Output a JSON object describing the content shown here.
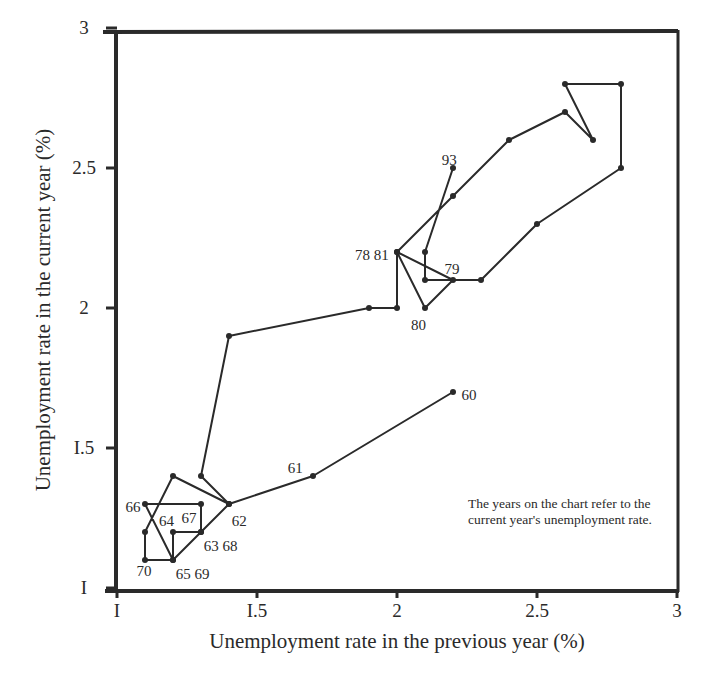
{
  "chart_data": {
    "type": "line",
    "subtype": "connected-scatter",
    "title": "",
    "xlabel": "Unemployment rate in the previous year (%)",
    "ylabel": "Unemployment rate in the current year (%)",
    "xlim": [
      1,
      3
    ],
    "ylim": [
      1,
      3
    ],
    "x_ticks": [
      "I",
      "I.5",
      "2",
      "2.5",
      "3"
    ],
    "x_tick_values": [
      1,
      1.5,
      2,
      2.5,
      3
    ],
    "y_ticks": [
      "I",
      "I.5",
      "2",
      "2.5",
      "3"
    ],
    "y_tick_values": [
      1,
      1.5,
      2,
      2.5,
      3
    ],
    "grid": false,
    "legend": null,
    "annotation": "The years on the chart refer to the current year's unemployment rate.",
    "series": [
      {
        "name": "Unemployment rate path 1960-1993",
        "points": [
          {
            "year": "60",
            "x": 2.2,
            "y": 1.7,
            "label": "60"
          },
          {
            "year": "61",
            "x": 1.7,
            "y": 1.4,
            "label": "61"
          },
          {
            "year": "62",
            "x": 1.4,
            "y": 1.3,
            "label": "62"
          },
          {
            "year": "63",
            "x": 1.3,
            "y": 1.2,
            "label": "63 68"
          },
          {
            "year": "64",
            "x": 1.2,
            "y": 1.1,
            "label": "65 69"
          },
          {
            "year": "65",
            "x": 1.1,
            "y": 1.3,
            "label": "66"
          },
          {
            "year": "66",
            "x": 1.3,
            "y": 1.3,
            "label": "67"
          },
          {
            "year": "67",
            "x": 1.3,
            "y": 1.2,
            "label": ""
          },
          {
            "year": "68",
            "x": 1.2,
            "y": 1.2,
            "label": "64"
          },
          {
            "year": "69",
            "x": 1.2,
            "y": 1.1,
            "label": ""
          },
          {
            "year": "70",
            "x": 1.1,
            "y": 1.1,
            "label": "70"
          },
          {
            "year": "71",
            "x": 1.1,
            "y": 1.2,
            "label": ""
          },
          {
            "year": "72",
            "x": 1.2,
            "y": 1.4,
            "label": ""
          },
          {
            "year": "73",
            "x": 1.4,
            "y": 1.3,
            "label": ""
          },
          {
            "year": "74",
            "x": 1.3,
            "y": 1.4,
            "label": ""
          },
          {
            "year": "75",
            "x": 1.4,
            "y": 1.9,
            "label": ""
          },
          {
            "year": "76",
            "x": 1.9,
            "y": 2.0,
            "label": ""
          },
          {
            "year": "77",
            "x": 2.0,
            "y": 2.0,
            "label": ""
          },
          {
            "year": "78",
            "x": 2.0,
            "y": 2.2,
            "label": "78 81"
          },
          {
            "year": "79",
            "x": 2.2,
            "y": 2.1,
            "label": "79"
          },
          {
            "year": "80",
            "x": 2.1,
            "y": 2.0,
            "label": "80"
          },
          {
            "year": "81",
            "x": 2.0,
            "y": 2.2,
            "label": ""
          },
          {
            "year": "82",
            "x": 2.2,
            "y": 2.4,
            "label": ""
          },
          {
            "year": "83",
            "x": 2.4,
            "y": 2.6,
            "label": ""
          },
          {
            "year": "84",
            "x": 2.6,
            "y": 2.7,
            "label": ""
          },
          {
            "year": "85",
            "x": 2.7,
            "y": 2.6,
            "label": ""
          },
          {
            "year": "86",
            "x": 2.6,
            "y": 2.8,
            "label": ""
          },
          {
            "year": "87",
            "x": 2.8,
            "y": 2.8,
            "label": ""
          },
          {
            "year": "88",
            "x": 2.8,
            "y": 2.5,
            "label": ""
          },
          {
            "year": "89",
            "x": 2.5,
            "y": 2.3,
            "label": ""
          },
          {
            "year": "90",
            "x": 2.3,
            "y": 2.1,
            "label": ""
          },
          {
            "year": "91",
            "x": 2.1,
            "y": 2.1,
            "label": ""
          },
          {
            "year": "92",
            "x": 2.1,
            "y": 2.2,
            "label": ""
          },
          {
            "year": "93",
            "x": 2.2,
            "y": 2.5,
            "label": "93"
          }
        ]
      }
    ],
    "point_labels": [
      {
        "text": "60",
        "x": 2.23,
        "y": 1.69
      },
      {
        "text": "61",
        "x": 1.61,
        "y": 1.43
      },
      {
        "text": "62",
        "x": 1.41,
        "y": 1.24
      },
      {
        "text": "63 68",
        "x": 1.31,
        "y": 1.15
      },
      {
        "text": "64",
        "x": 1.15,
        "y": 1.24
      },
      {
        "text": "67",
        "x": 1.23,
        "y": 1.25
      },
      {
        "text": "66",
        "x": 1.03,
        "y": 1.29
      },
      {
        "text": "65 69",
        "x": 1.21,
        "y": 1.05
      },
      {
        "text": "70",
        "x": 1.07,
        "y": 1.06
      },
      {
        "text": "78 81",
        "x": 1.85,
        "y": 2.19
      },
      {
        "text": "79",
        "x": 2.17,
        "y": 2.14
      },
      {
        "text": "80",
        "x": 2.05,
        "y": 1.94
      },
      {
        "text": "93",
        "x": 2.16,
        "y": 2.53
      }
    ]
  }
}
